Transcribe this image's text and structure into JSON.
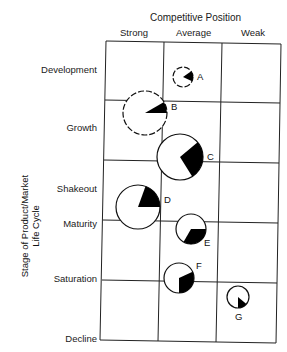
{
  "diagram": {
    "column_axis_title": "Competitive Position",
    "columns": [
      "Strong",
      "Average",
      "Weak"
    ],
    "row_axis_title": [
      "Stage of Product/Market",
      "Life Cycle"
    ],
    "rows": [
      "Development",
      "Growth",
      "Shakeout",
      "Maturity",
      "Saturation",
      "Decline"
    ],
    "bubbles": [
      {
        "label": "A",
        "cx": 183,
        "cy": 77,
        "r": 10,
        "wedge_start": -35,
        "wedge_end": 25,
        "dashed": true
      },
      {
        "label": "B",
        "cx": 145,
        "cy": 113,
        "r": 22,
        "wedge_start": -30,
        "wedge_end": 0,
        "dashed": true
      },
      {
        "label": "C",
        "cx": 180,
        "cy": 157,
        "r": 23,
        "wedge_start": -40,
        "wedge_end": 58,
        "dashed": false
      },
      {
        "label": "D",
        "cx": 138,
        "cy": 207,
        "r": 22,
        "wedge_start": -70,
        "wedge_end": 0,
        "dashed": false
      },
      {
        "label": "E",
        "cx": 191,
        "cy": 229,
        "r": 15,
        "wedge_start": 0,
        "wedge_end": 120,
        "dashed": false
      },
      {
        "label": "F",
        "cx": 179,
        "cy": 278,
        "r": 15,
        "wedge_start": -25,
        "wedge_end": 90,
        "dashed": false
      },
      {
        "label": "G",
        "cx": 238,
        "cy": 297,
        "r": 11,
        "wedge_start": 40,
        "wedge_end": 90,
        "dashed": false
      }
    ]
  }
}
